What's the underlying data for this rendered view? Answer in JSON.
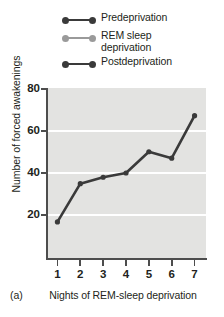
{
  "legend": {
    "position": "top",
    "items": [
      {
        "label": "Predeprivation",
        "color": "#3a3a3a",
        "marker": "line-with-dots"
      },
      {
        "label": "REM sleep\ndeprivation",
        "color": "#9a9a9a",
        "marker": "line-with-dots"
      },
      {
        "label": "Postdeprivation",
        "color": "#3a3a3a",
        "marker": "line-with-dots"
      }
    ]
  },
  "panel": {
    "label": "(a)"
  },
  "colors": {
    "plot_background": "#e3e3e1",
    "gridline": "#ffffff",
    "axis": "#4d4d4d",
    "series_dark": "#3a3a3a",
    "series_gray": "#9a9a9a",
    "text": "#231f20"
  },
  "chart_data": {
    "type": "line",
    "title": "",
    "xlabel": "Nights of REM-sleep deprivation",
    "ylabel": "Number of forced awakenings",
    "x": [
      1,
      2,
      3,
      4,
      5,
      6,
      7
    ],
    "xticklabels": [
      "1",
      "2",
      "3",
      "4",
      "5",
      "6",
      "7"
    ],
    "yticklabels": [
      "20",
      "40",
      "60",
      "80"
    ],
    "yticks": [
      20,
      40,
      60,
      80
    ],
    "xlim": [
      0.5,
      7.5
    ],
    "ylim": [
      0,
      80
    ],
    "grid": "horizontal",
    "legend_position": "above-plot",
    "series": [
      {
        "name": "REM sleep deprivation",
        "color": "#3a3a3a",
        "values": [
          17,
          35,
          38,
          40,
          50,
          47,
          67
        ]
      }
    ]
  }
}
